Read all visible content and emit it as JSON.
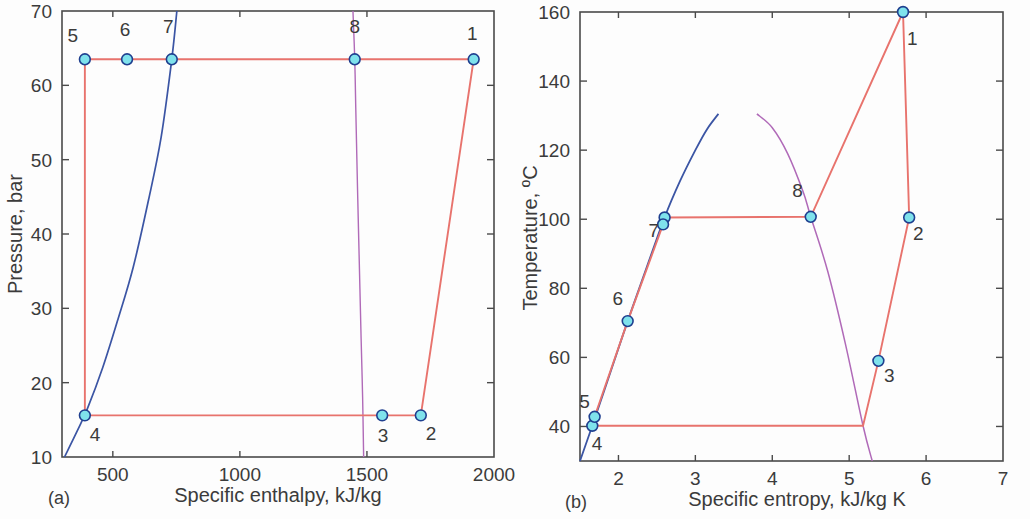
{
  "figure": {
    "background": "#fdfdfd",
    "colors": {
      "cycle_line": "#e8736d",
      "sat_liquid": "#3b55a4",
      "sat_vapor": "#b06ab8",
      "marker_fill": "#7fe2ec",
      "marker_edge": "#1f3f8f",
      "axis": "#4a4a4a",
      "text": "#3b3b3b"
    }
  },
  "panels": [
    {
      "id": "a",
      "panel_label": "(a)",
      "xlabel": "Specific enthalpy, kJ/kg",
      "ylabel": "Pressure, bar"
    },
    {
      "id": "b",
      "panel_label": "(b)",
      "xlabel": "Specific entropy, kJ/kg K",
      "ylabel": "Temperature, ºC"
    }
  ],
  "chart_data": [
    {
      "type": "scatter",
      "id": "ph-diagram",
      "title": "",
      "xlabel": "Specific enthalpy, kJ/kg",
      "ylabel": "Pressure, bar",
      "xlim": [
        300,
        2000
      ],
      "ylim": [
        10,
        70
      ],
      "xticks": [
        500,
        1000,
        1500,
        2000
      ],
      "yticks": [
        10,
        20,
        30,
        40,
        50,
        60,
        70
      ],
      "grid": false,
      "legend": "none",
      "points": [
        {
          "label": "1",
          "h": 1920,
          "p": 63.5,
          "lx": 1915,
          "ly": 67.0
        },
        {
          "label": "2",
          "h": 1712,
          "p": 15.6,
          "lx": 1752,
          "ly": 13.2
        },
        {
          "label": "3",
          "h": 1560,
          "p": 15.6,
          "lx": 1563,
          "ly": 13.0
        },
        {
          "label": "4",
          "h": 390,
          "p": 15.6,
          "lx": 430,
          "ly": 13.1
        },
        {
          "label": "5",
          "h": 390,
          "p": 63.5,
          "lx": 342,
          "ly": 66.8
        },
        {
          "label": "6",
          "h": 556,
          "p": 63.5,
          "lx": 548,
          "ly": 67.6
        },
        {
          "label": "7",
          "h": 732,
          "p": 63.5,
          "lx": 718,
          "ly": 68.0
        },
        {
          "label": "8",
          "h": 1452,
          "p": 63.5,
          "lx": 1452,
          "ly": 68.0
        }
      ],
      "cycle_path": [
        {
          "h": 1920,
          "p": 63.5
        },
        {
          "h": 1712,
          "p": 15.6
        },
        {
          "h": 1560,
          "p": 15.6
        },
        {
          "h": 390,
          "p": 15.6
        },
        {
          "h": 390,
          "p": 63.5
        },
        {
          "h": 556,
          "p": 63.5
        },
        {
          "h": 732,
          "p": 63.5
        },
        {
          "h": 1452,
          "p": 63.5
        },
        {
          "h": 1920,
          "p": 63.5
        }
      ],
      "sat_liquid_curve": [
        {
          "h": 310,
          "p": 10.0
        },
        {
          "h": 360,
          "p": 13.5
        },
        {
          "h": 400,
          "p": 16.5
        },
        {
          "h": 460,
          "p": 22.0
        },
        {
          "h": 520,
          "p": 28.5
        },
        {
          "h": 580,
          "p": 35.5
        },
        {
          "h": 640,
          "p": 44.5
        },
        {
          "h": 690,
          "p": 53.0
        },
        {
          "h": 732,
          "p": 63.5
        },
        {
          "h": 752,
          "p": 70.0
        }
      ],
      "sat_vapor_curve": [
        {
          "h": 1487,
          "p": 10.0
        },
        {
          "h": 1483,
          "p": 18.0
        },
        {
          "h": 1477,
          "p": 26.0
        },
        {
          "h": 1470,
          "p": 36.0
        },
        {
          "h": 1463,
          "p": 46.0
        },
        {
          "h": 1456,
          "p": 57.0
        },
        {
          "h": 1452,
          "p": 63.5
        },
        {
          "h": 1445,
          "p": 70.0
        }
      ]
    },
    {
      "type": "scatter",
      "id": "ts-diagram",
      "title": "",
      "xlabel": "Specific entropy, kJ/kg K",
      "ylabel": "Temperature, ºC",
      "xlim": [
        1.5,
        7.0
      ],
      "ylim": [
        30,
        160
      ],
      "xticks": [
        2,
        3,
        4,
        5,
        6,
        7
      ],
      "yticks": [
        40,
        60,
        80,
        100,
        120,
        140,
        160
      ],
      "grid": false,
      "legend": "none",
      "points": [
        {
          "label": "1",
          "s": 5.7,
          "t": 160.0,
          "lx": 5.82,
          "ly": 152.5
        },
        {
          "label": "2",
          "s": 5.78,
          "t": 100.5,
          "lx": 5.9,
          "ly": 96.0
        },
        {
          "label": "3",
          "s": 5.38,
          "t": 59.0,
          "lx": 5.52,
          "ly": 55.0
        },
        {
          "label": "4",
          "s": 1.66,
          "t": 40.2,
          "lx": 1.72,
          "ly": 35.3
        },
        {
          "label": "5",
          "s": 1.69,
          "t": 42.8,
          "lx": 1.56,
          "ly": 47.5
        },
        {
          "label": "6",
          "s": 2.12,
          "t": 70.5,
          "lx": 1.99,
          "ly": 77.2
        },
        {
          "label": "7",
          "s": 2.6,
          "t": 100.5,
          "lx": 2.46,
          "ly": 97.0
        },
        {
          "label": "7b",
          "s": 2.58,
          "t": 98.5,
          "lx": null,
          "ly": null
        },
        {
          "label": "8",
          "s": 4.5,
          "t": 100.7,
          "lx": 4.33,
          "ly": 108.5
        }
      ],
      "cycle_path": [
        {
          "s": 5.7,
          "t": 160.0
        },
        {
          "s": 5.78,
          "t": 100.5
        },
        {
          "s": 5.38,
          "t": 59.0
        },
        {
          "s": 5.18,
          "t": 40.2
        },
        {
          "s": 1.66,
          "t": 40.2
        },
        {
          "s": 1.69,
          "t": 42.8
        },
        {
          "s": 2.12,
          "t": 70.5
        },
        {
          "s": 2.58,
          "t": 98.5
        },
        {
          "s": 2.6,
          "t": 100.5
        },
        {
          "s": 4.5,
          "t": 100.7
        },
        {
          "s": 5.7,
          "t": 160.0
        }
      ],
      "sat_liquid_curve": [
        {
          "s": 1.5,
          "t": 30.0
        },
        {
          "s": 1.66,
          "t": 40.2
        },
        {
          "s": 1.9,
          "t": 56.0
        },
        {
          "s": 2.12,
          "t": 70.5
        },
        {
          "s": 2.35,
          "t": 85.0
        },
        {
          "s": 2.6,
          "t": 100.5
        },
        {
          "s": 2.8,
          "t": 111.0
        },
        {
          "s": 3.0,
          "t": 120.0
        },
        {
          "s": 3.15,
          "t": 126.0
        },
        {
          "s": 3.3,
          "t": 130.5
        }
      ],
      "sat_vapor_curve": [
        {
          "s": 3.8,
          "t": 130.5
        },
        {
          "s": 4.0,
          "t": 126.5
        },
        {
          "s": 4.2,
          "t": 119.0
        },
        {
          "s": 4.4,
          "t": 108.0
        },
        {
          "s": 4.5,
          "t": 100.7
        },
        {
          "s": 4.72,
          "t": 85.0
        },
        {
          "s": 4.95,
          "t": 64.0
        },
        {
          "s": 5.18,
          "t": 40.2
        },
        {
          "s": 5.3,
          "t": 30.0
        }
      ]
    }
  ]
}
